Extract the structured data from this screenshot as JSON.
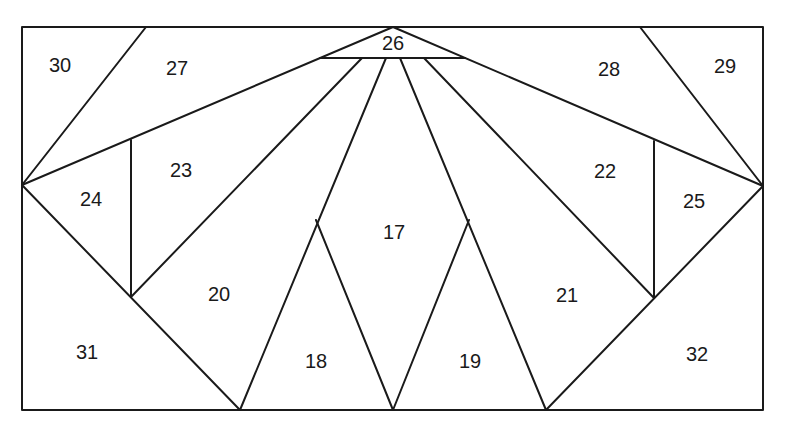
{
  "diagram": {
    "frame": {
      "x": 22,
      "y": 27,
      "width": 741,
      "height": 383
    },
    "stroke_color": "#1a1a1a",
    "background": "#ffffff",
    "edges": [
      [
        146,
        27,
        22,
        185
      ],
      [
        22,
        185,
        393,
        27
      ],
      [
        640,
        27,
        763,
        186
      ],
      [
        763,
        186,
        393,
        27
      ],
      [
        320,
        58,
        465,
        58
      ],
      [
        22,
        185,
        240,
        410
      ],
      [
        763,
        186,
        546,
        410
      ],
      [
        131,
        140,
        131,
        297
      ],
      [
        654,
        141,
        654,
        298
      ],
      [
        131,
        297,
        362,
        58
      ],
      [
        654,
        298,
        424,
        58
      ],
      [
        240,
        410,
        386,
        58
      ],
      [
        546,
        410,
        400,
        58
      ],
      [
        316,
        220,
        393,
        410
      ],
      [
        469,
        220,
        393,
        410
      ]
    ],
    "pieces": [
      {
        "id": "17",
        "x": 394,
        "y": 234
      },
      {
        "id": "18",
        "x": 316,
        "y": 363
      },
      {
        "id": "19",
        "x": 470,
        "y": 363
      },
      {
        "id": "20",
        "x": 219,
        "y": 296
      },
      {
        "id": "21",
        "x": 567,
        "y": 297
      },
      {
        "id": "22",
        "x": 605,
        "y": 173
      },
      {
        "id": "23",
        "x": 181,
        "y": 172
      },
      {
        "id": "24",
        "x": 91,
        "y": 201
      },
      {
        "id": "25",
        "x": 694,
        "y": 203
      },
      {
        "id": "26",
        "x": 393,
        "y": 45
      },
      {
        "id": "27",
        "x": 177,
        "y": 70
      },
      {
        "id": "28",
        "x": 609,
        "y": 71
      },
      {
        "id": "29",
        "x": 725,
        "y": 68
      },
      {
        "id": "30",
        "x": 60,
        "y": 67
      },
      {
        "id": "31",
        "x": 87,
        "y": 354
      },
      {
        "id": "32",
        "x": 697,
        "y": 356
      }
    ]
  }
}
